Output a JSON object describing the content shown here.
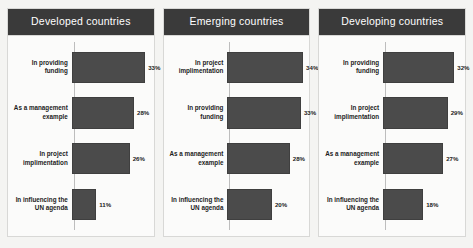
{
  "chart_data": {
    "type": "bar",
    "title": "",
    "xlabel": "",
    "ylabel": "",
    "grid": false,
    "legend": "none",
    "orientation": "horizontal",
    "value_suffix": "%",
    "xlim": [
      0,
      35
    ],
    "panels": [
      {
        "title": "Developed countries",
        "categories": [
          "In providing funding",
          "As a management example",
          "In project implimentation",
          "In influencing the UN agenda"
        ],
        "values": [
          33,
          28,
          26,
          11
        ],
        "labels": [
          "33%",
          "28%",
          "26%",
          "11%"
        ]
      },
      {
        "title": "Emerging countries",
        "categories": [
          "In project implimentation",
          "In providing funding",
          "As a management example",
          "In influencing the UN agenda"
        ],
        "values": [
          34,
          33,
          28,
          20
        ],
        "labels": [
          "34%",
          "33%",
          "28%",
          "20%"
        ]
      },
      {
        "title": "Developing countries",
        "categories": [
          "In providing funding",
          "In project implimentation",
          "As a management example",
          "In influencing the UN agenda"
        ],
        "values": [
          32,
          29,
          27,
          18
        ],
        "labels": [
          "32%",
          "29%",
          "27%",
          "18%"
        ]
      }
    ]
  },
  "colors": {
    "header_background": "#3a3a3a",
    "header_text": "#ffffff",
    "bar_fill": "#4b4b4b",
    "axis_line": "#bdbdbd",
    "panel_background": "#fbfbfa",
    "panel_border": "#d8d8d6",
    "page_background": "#f4f4f2",
    "label_text": "#1c1c1c"
  }
}
